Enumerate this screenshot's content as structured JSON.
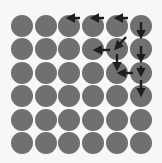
{
  "diagram": {
    "type": "grid-with-arrows",
    "rows": 6,
    "cols": 6,
    "origin": [
      11,
      15
    ],
    "pitch": [
      23.7,
      23.4
    ],
    "diameter": 22,
    "colors": {
      "background": "#f7f7f7",
      "circle": "#707070",
      "arrow": "#1e1e1e"
    },
    "arrows": [
      {
        "from": [
          80,
          18
        ],
        "to": [
          70,
          18
        ]
      },
      {
        "from": [
          104,
          18
        ],
        "to": [
          94,
          18
        ]
      },
      {
        "from": [
          128,
          18
        ],
        "to": [
          118,
          18
        ]
      },
      {
        "from": [
          141,
          22
        ],
        "to": [
          141,
          35
        ]
      },
      {
        "from": [
          141,
          46
        ],
        "to": [
          141,
          59
        ]
      },
      {
        "from": [
          126,
          37
        ],
        "to": [
          117,
          47
        ]
      },
      {
        "from": [
          110,
          50
        ],
        "to": [
          97,
          50
        ]
      },
      {
        "from": [
          117,
          54
        ],
        "to": [
          117,
          67
        ]
      },
      {
        "from": [
          141,
          66
        ],
        "to": [
          141,
          73
        ]
      },
      {
        "from": [
          133,
          73
        ],
        "to": [
          121,
          73
        ]
      },
      {
        "from": [
          141,
          80
        ],
        "to": [
          141,
          93
        ]
      }
    ]
  }
}
